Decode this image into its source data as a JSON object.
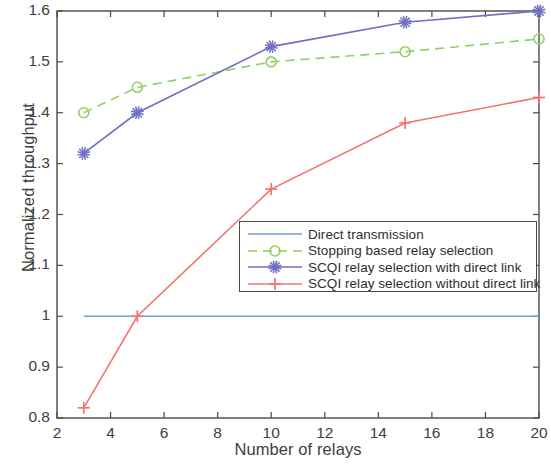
{
  "chart_data": {
    "type": "line",
    "title": "",
    "xlabel": "Number of relays",
    "ylabel": "Normalized throughput",
    "xlim": [
      2,
      20
    ],
    "ylim": [
      0.8,
      1.6
    ],
    "xticks": [
      "2",
      "4",
      "6",
      "8",
      "10",
      "12",
      "14",
      "16",
      "18",
      "20"
    ],
    "xtick_values": [
      2,
      4,
      6,
      8,
      10,
      12,
      14,
      16,
      18,
      20
    ],
    "yticks": [
      "0.8",
      "0.9",
      "1",
      "1.1",
      "1.2",
      "1.3",
      "1.4",
      "1.5",
      "1.6"
    ],
    "ytick_values": [
      0.8,
      0.9,
      1.0,
      1.1,
      1.2,
      1.3,
      1.4,
      1.5,
      1.6
    ],
    "grid": false,
    "legend_position": "center-right",
    "x": [
      3,
      5,
      10,
      15,
      20
    ],
    "series": [
      {
        "name": "Direct transmission",
        "values": [
          1.0,
          1.0,
          1.0,
          1.0,
          1.0
        ],
        "color": "#7799dd",
        "style": "solid",
        "marker": "none"
      },
      {
        "name": "Stopping based relay selection",
        "values": [
          1.4,
          1.45,
          1.5,
          1.52,
          1.545
        ],
        "color": "#8fd162",
        "style": "dashed",
        "marker": "circle"
      },
      {
        "name": "SCQI relay selection with direct link",
        "values": [
          1.32,
          1.4,
          1.53,
          1.578,
          1.6
        ],
        "color": "#6f6fc4",
        "style": "solid",
        "marker": "star"
      },
      {
        "name": "SCQI relay selection without direct link",
        "values": [
          0.82,
          1.0,
          1.25,
          1.38,
          1.43
        ],
        "color": "#f4736e",
        "style": "solid",
        "marker": "plus"
      }
    ]
  },
  "legend": {
    "items": [
      {
        "label": "Direct transmission"
      },
      {
        "label": "Stopping based relay selection"
      },
      {
        "label": "SCQI relay selection with direct link"
      },
      {
        "label": "SCQI relay selection without direct link"
      }
    ]
  }
}
